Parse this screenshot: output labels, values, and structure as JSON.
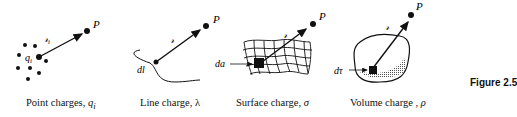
{
  "figure": {
    "label": "Figure 2.5",
    "panels": [
      {
        "id": "point",
        "caption": "Point charges, ",
        "caption_symbol": "q",
        "caption_sub": "i",
        "labels": {
          "point": "P",
          "charge": "q",
          "charge_sub": "i",
          "vector": "𝓇",
          "vector_sub": "i"
        }
      },
      {
        "id": "line",
        "caption": "Line charge, ",
        "caption_symbol": "λ",
        "labels": {
          "point": "P",
          "element": "dl",
          "vector": "𝓇"
        }
      },
      {
        "id": "surface",
        "caption": "Surface charge, ",
        "caption_symbol": "σ",
        "labels": {
          "point": "P",
          "element": "da",
          "vector": "𝓇"
        }
      },
      {
        "id": "volume",
        "caption": "Volume charge , ",
        "caption_symbol": "ρ",
        "labels": {
          "point": "P",
          "element": "dτ",
          "vector": "𝓇"
        }
      }
    ]
  }
}
